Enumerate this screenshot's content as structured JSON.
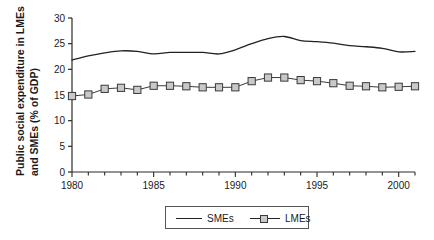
{
  "chart_data": {
    "type": "line",
    "title": "",
    "xlabel": "",
    "ylabel": "Public social expenditure in LMEs and SMEs (% of GDP)",
    "ylabel_line1": "Public social expenditure in LMEs",
    "ylabel_line2": "and SMEs (% of GDP)",
    "xlim": [
      1980,
      2001
    ],
    "ylim": [
      0,
      30
    ],
    "ytick_labels": [
      "0",
      "5",
      "10",
      "15",
      "20",
      "25",
      "30"
    ],
    "yticks": [
      0,
      5,
      10,
      15,
      20,
      25,
      30
    ],
    "xtick_labels": [
      "1980",
      "1985",
      "1990",
      "1995",
      "2000"
    ],
    "xticks": [
      1980,
      1985,
      1990,
      1995,
      2000
    ],
    "minor_xticks": [
      1981,
      1982,
      1983,
      1984,
      1986,
      1987,
      1988,
      1989,
      1991,
      1992,
      1993,
      1994,
      1996,
      1997,
      1998,
      1999,
      2001
    ],
    "grid": false,
    "legend_position": "below-center",
    "x": [
      1980,
      1981,
      1982,
      1983,
      1984,
      1985,
      1986,
      1987,
      1988,
      1989,
      1990,
      1991,
      1992,
      1993,
      1994,
      1995,
      1996,
      1997,
      1998,
      1999,
      2000,
      2001
    ],
    "series": [
      {
        "name": "SMEs",
        "marker": "none",
        "line_color": "#222222",
        "values": [
          21.8,
          22.6,
          23.2,
          23.6,
          23.5,
          23.0,
          23.3,
          23.3,
          23.3,
          23.0,
          23.8,
          25.0,
          26.0,
          26.4,
          25.6,
          25.4,
          25.1,
          24.6,
          24.4,
          24.1,
          23.4,
          23.5
        ]
      },
      {
        "name": "LMEs",
        "marker": "square",
        "marker_fill": "#c9c9c9",
        "marker_edge": "#3a3a3a",
        "line_color": "#3a3a3a",
        "values": [
          14.8,
          15.1,
          16.2,
          16.4,
          16.0,
          16.8,
          16.8,
          16.7,
          16.5,
          16.5,
          16.5,
          17.7,
          18.4,
          18.4,
          17.9,
          17.7,
          17.3,
          16.8,
          16.7,
          16.5,
          16.6,
          16.7
        ]
      }
    ]
  },
  "legend": {
    "entries": [
      {
        "label": "SMEs"
      },
      {
        "label": "LMEs"
      }
    ]
  }
}
